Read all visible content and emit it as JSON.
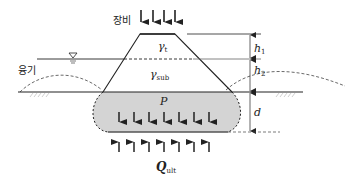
{
  "diagram": {
    "type": "geotechnical-cross-section",
    "labels": {
      "equipment": "장비",
      "heave": "융기",
      "gamma_t": "γ",
      "gamma_t_sub": "t",
      "gamma_sub": "γ",
      "gamma_sub_sub": "sub",
      "pressure": "P",
      "h1": "h",
      "h1_sub": "1",
      "h2": "h",
      "h2_sub": "2",
      "depth": "d",
      "q_ult": "Q",
      "q_ult_sub": "ult"
    },
    "colors": {
      "line": "#222222",
      "pressure_zone_fill": "#d4d4d4",
      "ground_hatch": "#b0b0b0"
    },
    "load_arrows_top": 4,
    "load_arrows_bottom": 7
  }
}
